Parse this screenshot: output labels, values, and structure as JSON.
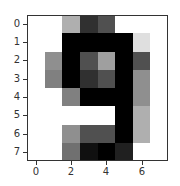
{
  "chart_data": {
    "type": "heatmap",
    "title": "",
    "xlabel": "",
    "ylabel": "",
    "colormap": "gray_r",
    "value_range": [
      0,
      16
    ],
    "x_ticks": [
      "0",
      "2",
      "4",
      "6"
    ],
    "y_ticks": [
      "0",
      "1",
      "2",
      "3",
      "4",
      "5",
      "6",
      "7"
    ],
    "xlim": [
      -0.5,
      7.5
    ],
    "ylim": [
      7.5,
      -0.5
    ],
    "grid": false,
    "matrix": [
      [
        0,
        0,
        5,
        13,
        11,
        0,
        0,
        0
      ],
      [
        0,
        0,
        16,
        16,
        16,
        16,
        2,
        0
      ],
      [
        0,
        7,
        16,
        11,
        6,
        16,
        11,
        0
      ],
      [
        0,
        8,
        16,
        13,
        11,
        16,
        7,
        0
      ],
      [
        0,
        0,
        8,
        16,
        16,
        16,
        7,
        0
      ],
      [
        0,
        0,
        0,
        0,
        0,
        16,
        5,
        0
      ],
      [
        0,
        0,
        7,
        11,
        11,
        16,
        5,
        0
      ],
      [
        0,
        0,
        9,
        15,
        16,
        14,
        0,
        0
      ]
    ]
  },
  "axes": {
    "x_tick_labels": [
      "0",
      "2",
      "4",
      "6"
    ],
    "y_tick_labels": [
      "0",
      "1",
      "2",
      "3",
      "4",
      "5",
      "6",
      "7"
    ]
  }
}
